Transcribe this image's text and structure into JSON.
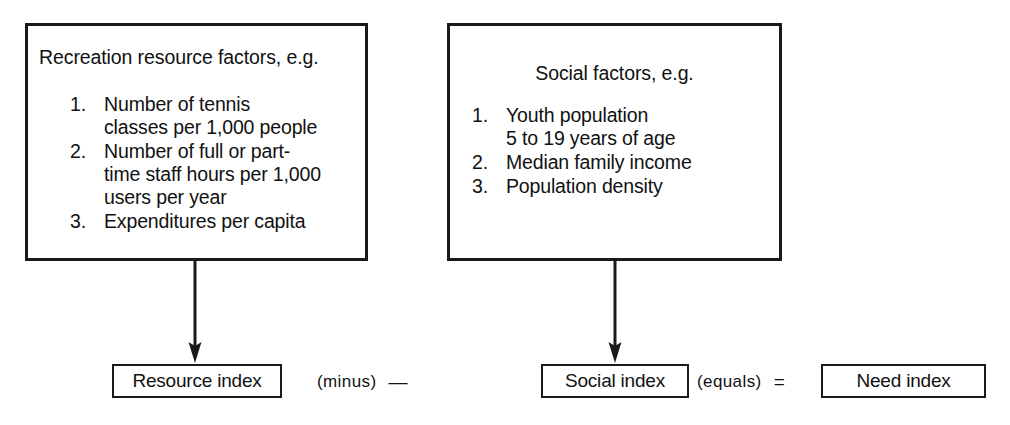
{
  "diagram": {
    "title_note": "Recreation need index derivation flow diagram",
    "boxes": {
      "resource": {
        "heading": "Recreation resource factors, e.g.",
        "items": [
          {
            "number": "1.",
            "text": "Number of tennis\nclasses per 1,000 people"
          },
          {
            "number": "2.",
            "text": "Number of full or part-\ntime staff hours per 1,000\nusers per year"
          },
          {
            "number": "3.",
            "text": "Expenditures per capita"
          }
        ]
      },
      "social": {
        "heading": "Social factors, e.g.",
        "items": [
          {
            "number": "1.",
            "text": "Youth population\n5 to 19 years of age"
          },
          {
            "number": "2.",
            "text": "Median family income"
          },
          {
            "number": "3.",
            "text": "Population density"
          }
        ]
      }
    },
    "indices": {
      "resource_index": "Resource index",
      "social_index": "Social index",
      "need_index": "Need index"
    },
    "operators": {
      "minus_word": "(minus)",
      "minus_sign": "—",
      "equals_word": "(equals)",
      "equals_sign": "="
    },
    "arrows": {
      "resource_arrow_name": "down-arrow-icon",
      "social_arrow_name": "down-arrow-icon"
    },
    "colors": {
      "ink": "#1a1a1a",
      "paper": "#ffffff"
    }
  }
}
